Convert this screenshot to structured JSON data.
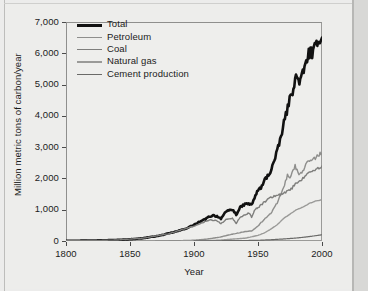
{
  "chart_data": {
    "type": "line",
    "title": "",
    "xlabel": "Year",
    "ylabel": "Million metric tons of carbon/year",
    "xlim": [
      1800,
      2000
    ],
    "ylim": [
      0,
      7000
    ],
    "xticks": [
      "1800",
      "1850",
      "1900",
      "1950",
      "2000"
    ],
    "xtick_values": [
      1800,
      1850,
      1900,
      1950,
      2000
    ],
    "yticks": [
      "0",
      "1,000",
      "2,000",
      "3,000",
      "4,000",
      "5,000",
      "6,000",
      "7,000"
    ],
    "ytick_values": [
      0,
      1000,
      2000,
      3000,
      4000,
      5000,
      6000,
      7000
    ],
    "grid": false,
    "legend_position": "top-left",
    "series": [
      {
        "name": "Total",
        "color": "#111111",
        "width": 2.6,
        "x": [
          1800,
          1810,
          1820,
          1830,
          1840,
          1850,
          1855,
          1860,
          1865,
          1870,
          1875,
          1880,
          1885,
          1890,
          1895,
          1900,
          1903,
          1906,
          1909,
          1912,
          1915,
          1918,
          1921,
          1924,
          1927,
          1930,
          1933,
          1936,
          1939,
          1942,
          1945,
          1948,
          1950,
          1953,
          1956,
          1959,
          1962,
          1965,
          1968,
          1971,
          1974,
          1977,
          1979,
          1981,
          1983,
          1985,
          1987,
          1989,
          1991,
          1993,
          1995,
          1997,
          1999,
          2000
        ],
        "values": [
          8,
          10,
          15,
          22,
          35,
          55,
          70,
          90,
          120,
          150,
          190,
          240,
          290,
          350,
          420,
          520,
          580,
          640,
          700,
          780,
          820,
          790,
          720,
          880,
          980,
          1000,
          850,
          1060,
          1160,
          1200,
          1150,
          1450,
          1620,
          1740,
          2010,
          2150,
          2480,
          2850,
          3350,
          3900,
          4400,
          4800,
          5200,
          5200,
          5100,
          5350,
          5600,
          5950,
          6050,
          5950,
          6250,
          6500,
          6350,
          6500
        ]
      },
      {
        "name": "Petroleum",
        "color": "#8e8e8c",
        "width": 1.4,
        "x": [
          1870,
          1880,
          1890,
          1900,
          1910,
          1920,
          1930,
          1940,
          1945,
          1950,
          1955,
          1960,
          1965,
          1970,
          1973,
          1975,
          1979,
          1982,
          1985,
          1988,
          1991,
          1994,
          1997,
          2000
        ],
        "values": [
          2,
          5,
          12,
          25,
          60,
          120,
          220,
          300,
          320,
          480,
          700,
          890,
          1220,
          1700,
          2100,
          1980,
          2400,
          2150,
          2220,
          2500,
          2560,
          2620,
          2750,
          2810
        ]
      },
      {
        "name": "Coal",
        "color": "#7e7e7c",
        "width": 1.4,
        "x": [
          1800,
          1820,
          1840,
          1860,
          1880,
          1900,
          1910,
          1913,
          1918,
          1921,
          1925,
          1930,
          1933,
          1936,
          1939,
          1943,
          1945,
          1948,
          1950,
          1955,
          1960,
          1965,
          1970,
          1975,
          1980,
          1985,
          1990,
          1993,
          1996,
          2000
        ],
        "values": [
          8,
          15,
          32,
          90,
          230,
          480,
          640,
          680,
          640,
          560,
          680,
          720,
          560,
          760,
          820,
          900,
          760,
          1030,
          1060,
          1250,
          1400,
          1450,
          1520,
          1620,
          1850,
          2000,
          2200,
          2250,
          2300,
          2400
        ]
      },
      {
        "name": "Natural gas",
        "color": "#9a9a98",
        "width": 1.4,
        "x": [
          1890,
          1900,
          1910,
          1920,
          1930,
          1940,
          1950,
          1955,
          1960,
          1965,
          1970,
          1975,
          1980,
          1985,
          1990,
          1995,
          2000
        ],
        "values": [
          2,
          5,
          12,
          25,
          60,
          90,
          180,
          260,
          380,
          520,
          720,
          860,
          1000,
          1080,
          1200,
          1280,
          1320
        ]
      },
      {
        "name": "Cement production",
        "color": "#6a6a68",
        "width": 1.2,
        "x": [
          1900,
          1920,
          1940,
          1950,
          1960,
          1970,
          1980,
          1990,
          2000
        ],
        "values": [
          2,
          8,
          15,
          22,
          40,
          65,
          95,
          140,
          200
        ]
      }
    ]
  },
  "legend": {
    "items": [
      {
        "label": "Total"
      },
      {
        "label": "Petroleum"
      },
      {
        "label": "Coal"
      },
      {
        "label": "Natural gas"
      },
      {
        "label": "Cement production"
      }
    ]
  }
}
